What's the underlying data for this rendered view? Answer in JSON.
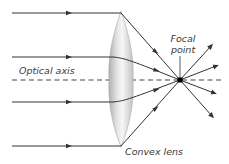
{
  "labels": {
    "focal_line1": "Focal",
    "focal_line2": "point",
    "optical_axis": "Optical axis",
    "lens": "Convex lens"
  },
  "colors": {
    "ray": "#333333",
    "axis": "#444444",
    "lens_fill_edge": "#b9b9b9",
    "lens_fill_center": "#f2f2f2",
    "text": "#3a3a3a"
  },
  "geometry": {
    "incoming_ray_y": [
      13,
      57,
      102,
      146
    ],
    "lens_x_center": 121,
    "focal_point": [
      180,
      80
    ],
    "axis_y": 80
  }
}
